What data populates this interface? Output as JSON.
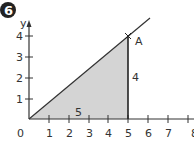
{
  "problem": {
    "number": "6"
  },
  "axes": {
    "x_label": "",
    "y_label": "y",
    "origin_label": "0",
    "x_ticks": [
      "1",
      "2",
      "3",
      "4",
      "5",
      "6",
      "7",
      "8"
    ],
    "y_ticks": [
      "1",
      "2",
      "3",
      "4"
    ]
  },
  "figure": {
    "point_label": "A",
    "horizontal_side_label": "5",
    "vertical_side_label": "4",
    "fill_color": "#d4d4d4",
    "line_color": "#333333"
  }
}
